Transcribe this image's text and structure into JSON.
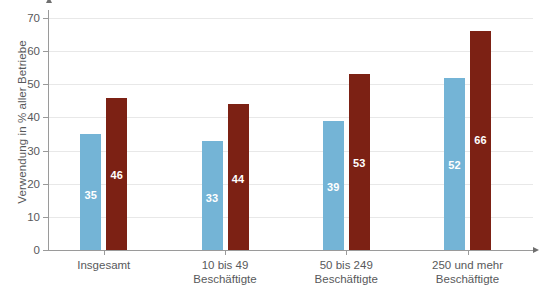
{
  "chart_data": {
    "type": "bar",
    "title": "",
    "xlabel": "",
    "ylabel": "Verwendung in % aller Betriebe",
    "ylim": [
      0,
      70
    ],
    "yticks": [
      0,
      10,
      20,
      30,
      40,
      50,
      60,
      70
    ],
    "grid": true,
    "legend_position": "none",
    "categories": [
      {
        "line1": "Insgesamt",
        "line2": ""
      },
      {
        "line1": "10 bis 49",
        "line2": "Beschäftigte"
      },
      {
        "line1": "50 bis 249",
        "line2": "Beschäftigte"
      },
      {
        "line1": "250 und mehr",
        "line2": "Beschäftigte"
      }
    ],
    "category_labels": [
      "Insgesamt",
      "10 bis 49 Beschäftigte",
      "50 bis 249 Beschäftigte",
      "250 und mehr Beschäftigte"
    ],
    "series": [
      {
        "name": "Reihe 1",
        "color": "#74b4d6",
        "values": [
          35,
          33,
          39,
          52
        ]
      },
      {
        "name": "Reihe 2",
        "color": "#7c2114",
        "values": [
          46,
          44,
          53,
          66
        ]
      }
    ],
    "colors": {
      "blue": "#74b4d6",
      "red": "#7c2114",
      "axis": "#9a9a9a",
      "grid": "#e8e8e8",
      "text": "#58595b",
      "value_label": "#ffffff"
    }
  },
  "axis": {
    "tick_labels": [
      "0",
      "10",
      "20",
      "30",
      "40",
      "50",
      "60",
      "70"
    ]
  }
}
